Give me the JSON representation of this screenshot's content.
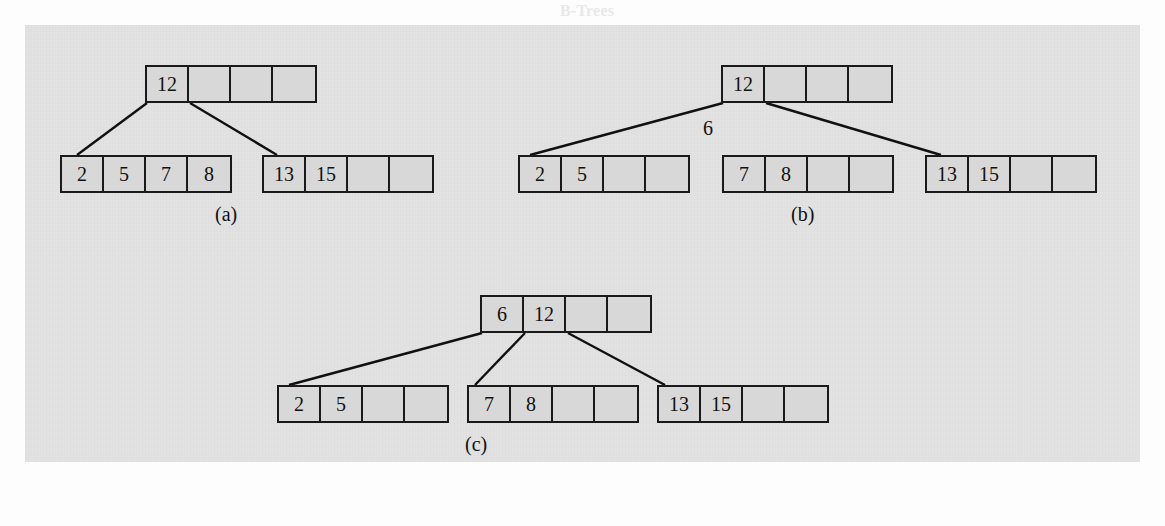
{
  "figure": {
    "background_color": "#e3e3e3",
    "node_fill_color": "#d8d8d8",
    "node_border_color": "#1a1a1a",
    "subfigures": [
      {
        "id": "a",
        "caption": "(a)",
        "root": {
          "cells": [
            "12",
            "",
            "",
            ""
          ]
        },
        "children": [
          {
            "cells": [
              "2",
              "5",
              "7",
              "8"
            ]
          },
          {
            "cells": [
              "13",
              "15",
              "",
              ""
            ]
          }
        ],
        "floating_label": ""
      },
      {
        "id": "b",
        "caption": "(b)",
        "root": {
          "cells": [
            "12",
            "",
            "",
            ""
          ]
        },
        "children": [
          {
            "cells": [
              "2",
              "5",
              "",
              ""
            ]
          },
          {
            "cells": [
              "7",
              "8",
              "",
              ""
            ]
          },
          {
            "cells": [
              "13",
              "15",
              "",
              ""
            ]
          }
        ],
        "floating_label": "6"
      },
      {
        "id": "c",
        "caption": "(c)",
        "root": {
          "cells": [
            "6",
            "12",
            "",
            ""
          ]
        },
        "children": [
          {
            "cells": [
              "2",
              "5",
              "",
              ""
            ]
          },
          {
            "cells": [
              "7",
              "8",
              "",
              ""
            ]
          },
          {
            "cells": [
              "13",
              "15",
              "",
              ""
            ]
          }
        ],
        "floating_label": ""
      }
    ]
  },
  "ghost_text": {
    "top_heading": "B-Trees",
    "lines": [
      "Insertion into a B-Tree",
      "sorted order from the node, from the node to the left, and from the node to the",
      "right. We then divide these keys in three, so that every node has the same number",
      "of keys as possible. When inserting a node, we might need to split the node, in which",
      "case we split two top-level sibling nodes and insert a new one for the ancestor key to the",
      "smallest, then this process continues up the tree, and this may cause the parent to split",
      "in its special property.",
      "Here, a key can continue to be in the internal nodes when there was an entry there in",
      "the overflowing node. The node splits and the key moves up, becoming the parent of the",
      "node that was split. If the parent is full, we can re-split the parent. This process propagates up.",
      "The interesting case we need to consider is what happens when the root must be split."
    ]
  }
}
